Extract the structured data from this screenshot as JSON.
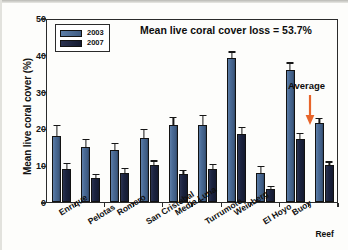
{
  "chart_data": {
    "type": "bar",
    "title": "Mean live coral cover loss = 53.7%",
    "xlabel": "",
    "ylabel": "Mean live coral cover (%)",
    "ylim": [
      0,
      50
    ],
    "yticks": [
      0,
      10,
      20,
      30,
      40,
      50
    ],
    "grid": false,
    "legend_position": "upper-left-inside",
    "categories": [
      "Enrique",
      "Pelotas",
      "Romero",
      "San Cristobal",
      "Media Luna",
      "Turrumote",
      "Weinberg",
      "El Hoyo",
      "Buoy",
      "Parguera Reef"
    ],
    "series": [
      {
        "name": "2003",
        "color": "#4a6b96",
        "values": [
          18.0,
          15.0,
          14.0,
          17.5,
          21.0,
          21.0,
          39.0,
          8.0,
          36.0,
          21.5
        ],
        "errors": [
          2.6,
          1.8,
          1.8,
          2.0,
          1.8,
          2.4,
          1.6,
          1.4,
          1.6,
          1.0
        ]
      },
      {
        "name": "2007",
        "color": "#1a2340",
        "values": [
          9.0,
          6.5,
          8.0,
          10.0,
          7.5,
          9.0,
          18.5,
          3.5,
          17.0,
          10.0
        ],
        "errors": [
          1.3,
          0.9,
          1.0,
          1.0,
          0.9,
          1.0,
          1.6,
          0.6,
          1.4,
          0.7
        ]
      }
    ],
    "annotations": [
      {
        "text": "Average",
        "arrow": true,
        "arrow_color": "#e8652a",
        "points_to": "Parguera Reef"
      }
    ]
  }
}
